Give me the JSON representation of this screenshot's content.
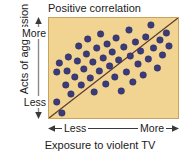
{
  "chart_data": {
    "type": "scatter",
    "title": "Positive correlation",
    "xlabel": "Exposure to violent TV",
    "ylabel": "Acts of aggression",
    "x_tick_labels": [
      "Less",
      "More"
    ],
    "y_tick_labels": [
      "More",
      "Less"
    ],
    "xlim": [
      0,
      100
    ],
    "ylim": [
      0,
      100
    ],
    "grid": false,
    "legend": null,
    "axis_style": "double-headed-arrow",
    "colors": {
      "plot_background": "#f2d492",
      "point": "#3b3b7a",
      "point_edge": "#2a2a5c",
      "trend_line": "#5a3a2e",
      "plot_border": "#c9a25e",
      "page_background": "#ffffff",
      "text": "#1a1a1a",
      "axis_arrow": "#8a8a8a"
    },
    "trend_line": {
      "description": "Straight positive-slope line from lower-left to upper-right",
      "x0": 0,
      "y0": 0,
      "x1": 100,
      "y1": 100
    },
    "points": [
      {
        "x": 6,
        "y": 16
      },
      {
        "x": 6,
        "y": 46
      },
      {
        "x": 8,
        "y": 55
      },
      {
        "x": 10,
        "y": 5
      },
      {
        "x": 13,
        "y": 33
      },
      {
        "x": 14,
        "y": 47
      },
      {
        "x": 15,
        "y": 61
      },
      {
        "x": 17,
        "y": 24
      },
      {
        "x": 20,
        "y": 41
      },
      {
        "x": 22,
        "y": 57
      },
      {
        "x": 23,
        "y": 72
      },
      {
        "x": 25,
        "y": 33
      },
      {
        "x": 27,
        "y": 49
      },
      {
        "x": 29,
        "y": 64
      },
      {
        "x": 30,
        "y": 79
      },
      {
        "x": 32,
        "y": 40
      },
      {
        "x": 34,
        "y": 56
      },
      {
        "x": 35,
        "y": 26
      },
      {
        "x": 37,
        "y": 70
      },
      {
        "x": 39,
        "y": 47
      },
      {
        "x": 40,
        "y": 84
      },
      {
        "x": 42,
        "y": 60
      },
      {
        "x": 44,
        "y": 34
      },
      {
        "x": 45,
        "y": 74
      },
      {
        "x": 47,
        "y": 52
      },
      {
        "x": 49,
        "y": 66
      },
      {
        "x": 51,
        "y": 41
      },
      {
        "x": 52,
        "y": 80
      },
      {
        "x": 54,
        "y": 58
      },
      {
        "x": 56,
        "y": 27
      },
      {
        "x": 58,
        "y": 71
      },
      {
        "x": 60,
        "y": 46
      },
      {
        "x": 62,
        "y": 88
      },
      {
        "x": 63,
        "y": 62
      },
      {
        "x": 65,
        "y": 36
      },
      {
        "x": 67,
        "y": 76
      },
      {
        "x": 69,
        "y": 54
      },
      {
        "x": 71,
        "y": 67
      },
      {
        "x": 73,
        "y": 43
      },
      {
        "x": 75,
        "y": 81
      },
      {
        "x": 77,
        "y": 59
      },
      {
        "x": 79,
        "y": 93
      },
      {
        "x": 81,
        "y": 70
      },
      {
        "x": 84,
        "y": 50
      },
      {
        "x": 86,
        "y": 78
      },
      {
        "x": 88,
        "y": 63
      },
      {
        "x": 91,
        "y": 85
      },
      {
        "x": 93,
        "y": 72
      }
    ]
  },
  "chart": {
    "title": "Positive correlation",
    "x_axis": {
      "label": "Exposure to violent TV",
      "left_tick": "Less",
      "right_tick": "More"
    },
    "y_axis": {
      "label": "Acts of aggression",
      "top_tick": "More",
      "bottom_tick": "Less"
    }
  }
}
